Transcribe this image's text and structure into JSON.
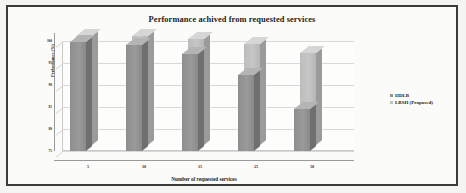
{
  "chart_data": {
    "type": "bar",
    "title": "Performance achived from requested services",
    "xlabel": "Number of requested services",
    "ylabel": "Performance (%)",
    "categories": [
      "5",
      "10",
      "15",
      "25",
      "50"
    ],
    "series": [
      {
        "name": "HDLB",
        "values": [
          98,
          97.5,
          95.5,
          91,
          84
        ],
        "color": "#949494"
      },
      {
        "name": "LBSH (Proposed)",
        "values": [
          98,
          98,
          97.5,
          96.5,
          94.5
        ],
        "color": "#c2c2c2"
      }
    ],
    "ylim": [
      75,
      100
    ],
    "yticks": [
      "100",
      "95",
      "90",
      "85",
      "80",
      "75"
    ],
    "grid": true,
    "legend_position": "right",
    "style": "3d-grouped-column",
    "frame_color": "#3a3a3a",
    "background": "#fbfbfa"
  }
}
